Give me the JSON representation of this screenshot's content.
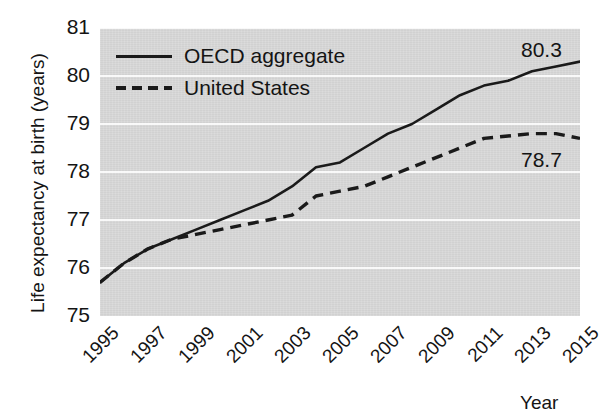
{
  "chart_data": {
    "type": "line",
    "title": "",
    "xlabel": "Year",
    "ylabel": "Life expectancy at birth (years)",
    "xlim": [
      1995,
      2015
    ],
    "ylim": [
      75,
      81
    ],
    "grid": true,
    "legend_position": "top-left",
    "x": [
      1995,
      1996,
      1997,
      1998,
      1999,
      2000,
      2001,
      2002,
      2003,
      2004,
      2005,
      2006,
      2007,
      2008,
      2009,
      2010,
      2011,
      2012,
      2013,
      2014,
      2015
    ],
    "series": [
      {
        "name": "OECD aggregate",
        "style": "solid",
        "color": "#1a1a1a",
        "values": [
          75.7,
          76.1,
          76.4,
          76.6,
          76.8,
          77.0,
          77.2,
          77.4,
          77.7,
          78.1,
          78.2,
          78.5,
          78.8,
          79.0,
          79.3,
          79.6,
          79.8,
          79.9,
          80.1,
          80.2,
          80.3
        ],
        "end_label": "80.3"
      },
      {
        "name": "United States",
        "style": "dashed",
        "color": "#1a1a1a",
        "values": [
          75.7,
          76.1,
          76.4,
          76.6,
          76.7,
          76.8,
          76.9,
          77.0,
          77.1,
          77.5,
          77.6,
          77.7,
          77.9,
          78.1,
          78.3,
          78.5,
          78.7,
          78.75,
          78.8,
          78.8,
          78.7
        ],
        "end_label": "78.7"
      }
    ],
    "yticks": [
      75,
      76,
      77,
      78,
      79,
      80,
      81
    ],
    "xticks": [
      1995,
      1997,
      1999,
      2001,
      2003,
      2005,
      2007,
      2009,
      2011,
      2013,
      2015
    ],
    "xtick_labels": [
      "1995",
      "1997",
      "1999",
      "2001",
      "2003",
      "2005",
      "2007",
      "2009",
      "2011",
      "2013",
      "2015"
    ],
    "ytick_labels": [
      "75",
      "76",
      "77",
      "78",
      "79",
      "80",
      "81"
    ]
  },
  "legend": {
    "items": [
      {
        "label": "OECD aggregate",
        "key": "solid-line-key"
      },
      {
        "label": "United States",
        "key": "dashed-line-key"
      }
    ]
  },
  "annotations": {
    "oecd_end": "80.3",
    "us_end": "78.7"
  },
  "axes": {
    "y_title": "Life expectancy at birth (years)",
    "x_title": "Year"
  }
}
